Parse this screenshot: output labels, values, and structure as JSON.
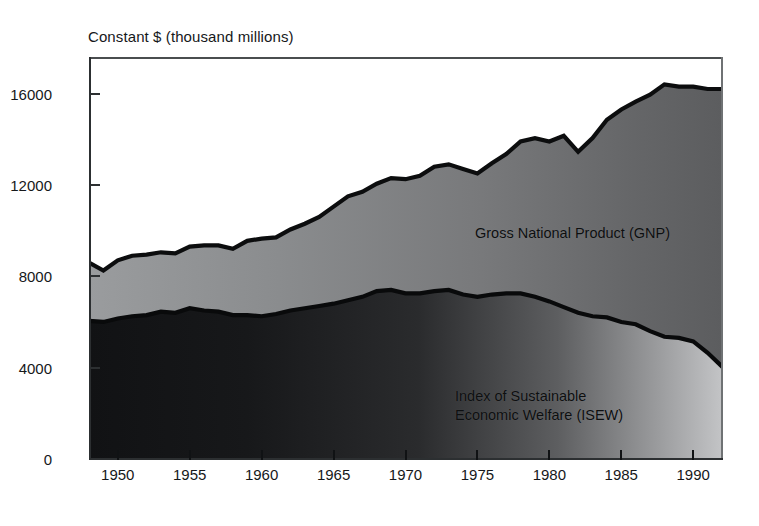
{
  "chart_data": {
    "type": "area",
    "title": "Constant $ (thousand millions)",
    "xlabel": "",
    "ylabel": "Constant $ (thousand millions)",
    "xlim": [
      1948,
      1992
    ],
    "ylim": [
      0,
      17600
    ],
    "grid": false,
    "stacked": false,
    "legend_position": "inside-annotations",
    "yticks": [
      0,
      4000,
      8000,
      12000,
      16000
    ],
    "ytick_labels": [
      "0",
      "4000",
      "8000",
      "12000",
      "16000"
    ],
    "xticks": [
      1950,
      1955,
      1960,
      1965,
      1970,
      1975,
      1980,
      1985,
      1990
    ],
    "xtick_labels": [
      "1950",
      "1955",
      "1960",
      "1965",
      "1970",
      "1975",
      "1980",
      "1985",
      "1990"
    ],
    "x": [
      1948,
      1949,
      1950,
      1951,
      1952,
      1953,
      1954,
      1955,
      1956,
      1957,
      1958,
      1959,
      1960,
      1961,
      1962,
      1963,
      1964,
      1965,
      1966,
      1967,
      1968,
      1969,
      1970,
      1971,
      1972,
      1973,
      1974,
      1975,
      1976,
      1977,
      1978,
      1979,
      1980,
      1981,
      1982,
      1983,
      1984,
      1985,
      1986,
      1987,
      1988,
      1989,
      1990,
      1991,
      1992
    ],
    "series": [
      {
        "name": "Gross National Product (GNP)",
        "label": "Gross National Product (GNP)",
        "color": "#7b7d7f",
        "values": [
          8600,
          8250,
          8700,
          8900,
          8950,
          9050,
          9000,
          9300,
          9350,
          9350,
          9200,
          9550,
          9650,
          9700,
          10050,
          10300,
          10600,
          11050,
          11500,
          11700,
          12050,
          12300,
          12250,
          12400,
          12800,
          12900,
          12700,
          12500,
          12950,
          13350,
          13900,
          14050,
          13900,
          14150,
          13450,
          14050,
          14850,
          15300,
          15650,
          15950,
          16400,
          16300,
          16300,
          16200,
          16200
        ]
      },
      {
        "name": "Index of Sustainable Economic Welfare (ISEW)",
        "label": "Index of Sustainable\nEconomic Welfare (ISEW)",
        "color": "#1b1c1e",
        "values": [
          6050,
          6000,
          6150,
          6250,
          6300,
          6450,
          6400,
          6600,
          6500,
          6450,
          6300,
          6300,
          6250,
          6350,
          6500,
          6600,
          6700,
          6800,
          6950,
          7100,
          7350,
          7400,
          7250,
          7250,
          7350,
          7400,
          7200,
          7100,
          7200,
          7250,
          7250,
          7100,
          6900,
          6650,
          6400,
          6250,
          6200,
          6000,
          5900,
          5600,
          5350,
          5300,
          5150,
          4650,
          4050
        ]
      }
    ],
    "annotations": [
      {
        "text": "Gross National Product (GNP)",
        "x": 1981,
        "y": 10400
      },
      {
        "text": "Index of Sustainable Economic Welfare (ISEW)",
        "x": 1980,
        "y": 3300
      }
    ]
  }
}
